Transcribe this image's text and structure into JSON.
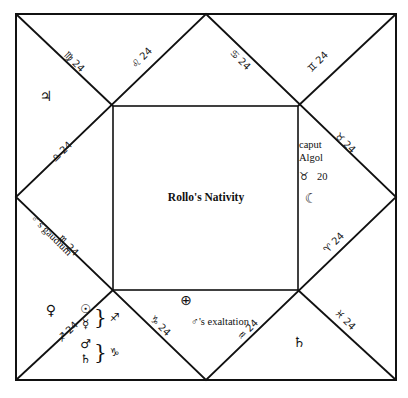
{
  "chart": {
    "title": "Rollo's Nativity",
    "type": "square-horoscope",
    "degree_common": "24",
    "cusps": [
      {
        "id": "cusp-virgo",
        "sign": "Virgo",
        "glyph": "♍",
        "degree": "24",
        "x": 74,
        "y": 62,
        "rot": 45
      },
      {
        "id": "cusp-leo",
        "sign": "Leo",
        "glyph": "♌",
        "degree": "24",
        "x": 142,
        "y": 58,
        "rot": -45
      },
      {
        "id": "cusp-cancer",
        "sign": "Cancer",
        "glyph": "♋",
        "degree": "24",
        "x": 240,
        "y": 60,
        "rot": 45
      },
      {
        "id": "cusp-gemini",
        "sign": "Gemini",
        "glyph": "♊",
        "degree": "24",
        "x": 318,
        "y": 62,
        "rot": -45
      },
      {
        "id": "cusp-taurus",
        "sign": "Taurus",
        "glyph": "♉",
        "degree": "24",
        "x": 345,
        "y": 143,
        "rot": 45
      },
      {
        "id": "cusp-aries",
        "sign": "Aries",
        "glyph": "♈",
        "degree": "24",
        "x": 334,
        "y": 243,
        "rot": -45
      },
      {
        "id": "cusp-pisces",
        "sign": "Pisces",
        "glyph": "♓",
        "degree": "24",
        "x": 345,
        "y": 320,
        "rot": 45
      },
      {
        "id": "cusp-aquarius",
        "sign": "Aquarius",
        "glyph": "♒",
        "degree": "24",
        "x": 248,
        "y": 330,
        "rot": -45
      },
      {
        "id": "cusp-capricorn",
        "sign": "Capricorn",
        "glyph": "♑",
        "degree": "24",
        "x": 160,
        "y": 326,
        "rot": 45
      },
      {
        "id": "cusp-sagittarius",
        "sign": "Sagittarius",
        "glyph": "♐",
        "degree": "24",
        "x": 68,
        "y": 332,
        "rot": -45
      },
      {
        "id": "cusp-scorpio",
        "sign": "Scorpio",
        "glyph": "♏",
        "degree": "24",
        "x": 68,
        "y": 246,
        "rot": 45
      },
      {
        "id": "cusp-libra",
        "sign": "Libra",
        "glyph": "♎",
        "degree": "24",
        "x": 62,
        "y": 152,
        "rot": -45
      }
    ],
    "planets": [
      {
        "id": "planet-jupiter",
        "name": "Jupiter",
        "glyph": "♃",
        "x": 46,
        "y": 96
      },
      {
        "id": "planet-venus",
        "name": "Venus",
        "glyph": "♀",
        "x": 51,
        "y": 310
      },
      {
        "id": "planet-moon",
        "name": "Moon",
        "glyph": "☾",
        "x": 311,
        "y": 198
      },
      {
        "id": "planet-saturn-pisces",
        "name": "Saturn",
        "glyph": "♄",
        "x": 299,
        "y": 342
      }
    ],
    "groups": [
      {
        "id": "group-sagittarius",
        "members": [
          {
            "id": "planet-sun",
            "name": "Sun",
            "glyph": "☉"
          },
          {
            "id": "planet-mercury",
            "name": "Mercury",
            "glyph": "☿"
          }
        ],
        "sign_glyph": "♐",
        "sign": "Sagittarius",
        "x": 100,
        "y": 317
      },
      {
        "id": "group-capricorn",
        "members": [
          {
            "id": "planet-mars",
            "name": "Mars",
            "glyph": "♂"
          },
          {
            "id": "planet-saturn-cap",
            "name": "Saturn",
            "glyph": "♄"
          }
        ],
        "sign_glyph": "♑",
        "sign": "Capricorn",
        "x": 100,
        "y": 352
      }
    ],
    "annotations": [
      {
        "id": "annot-caput-algol-line1",
        "text": "caput",
        "x": 299,
        "y": 146
      },
      {
        "id": "annot-caput-algol-line2",
        "text": "Algol",
        "x": 299,
        "y": 159
      },
      {
        "id": "annot-mars-gaudium",
        "text": "♂'s gaudium",
        "x": 36,
        "y": 213,
        "rot": 45
      },
      {
        "id": "annot-mars-exaltation",
        "text": "♂'s exaltation",
        "x": 176,
        "y": 322
      }
    ],
    "fixed_star": {
      "id": "fixed-star-algol",
      "name": "caput Algol",
      "sign_glyph": "♉",
      "sign": "Taurus",
      "degree": "20",
      "x": 302,
      "y": 174
    },
    "part_of_fortune": {
      "id": "part-of-fortune",
      "glyph": "⊕",
      "name": "Part of Fortune",
      "x": 186,
      "y": 300
    }
  },
  "geometry": {
    "outer": {
      "x": 16,
      "y": 14,
      "w": 380,
      "h": 366
    },
    "inner": {
      "x": 113,
      "y": 106,
      "w": 185,
      "h": 184
    },
    "stroke": "#111111",
    "background": "#ffffff"
  }
}
